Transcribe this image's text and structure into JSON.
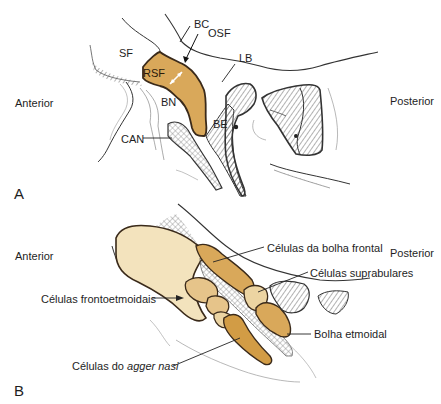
{
  "panel_a": {
    "letter": "A",
    "orientation": {
      "anterior": "Anterior",
      "posterior": "Posterior"
    },
    "labels": {
      "bc": "BC",
      "osf": "OSF",
      "sf": "SF",
      "rsf": "RSF",
      "lb": "LB",
      "bn": "BN",
      "be": "BE",
      "can": "CAN"
    }
  },
  "panel_b": {
    "letter": "B",
    "orientation": {
      "anterior": "Anterior",
      "posterior": "Posterior"
    },
    "labels": {
      "frontal_bulla_cells": "Células da bolha frontal",
      "suprabullar_cells": "Células suprabulares",
      "frontoethmoidal_cells": "Células frontoetmoidais",
      "ethmoid_bulla": "Bolha etmoidal",
      "agger_nasi_prefix": "Células do ",
      "agger_nasi_italic": "agger nasi"
    }
  },
  "colors": {
    "highlight_orange": "#d9a85a",
    "cell_light": "#f3e3bd",
    "cell_mid": "#e6c48a",
    "cell_dark": "#d29c45",
    "outline": "#3a2a1a",
    "hatch": "#777777"
  }
}
